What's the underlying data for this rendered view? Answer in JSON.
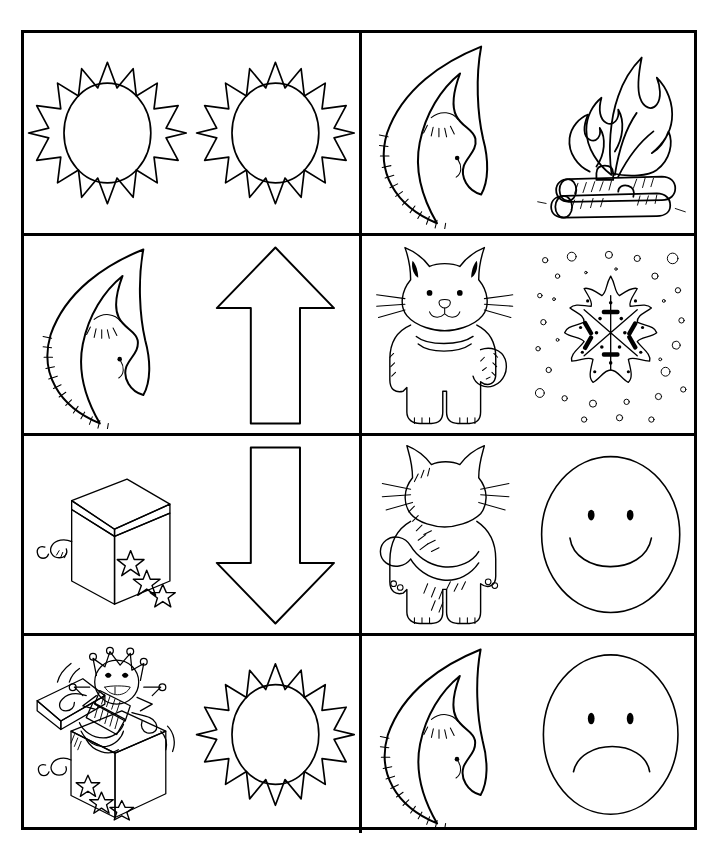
{
  "document": {
    "title": "Opposites Picture Cards Worksheet",
    "style": "black-and-white line art, uncolored",
    "background_color": "#ffffff",
    "ink_color": "#000000",
    "grid": {
      "rows": 4,
      "columns": 2,
      "cell_count": 8
    }
  },
  "cells": [
    {
      "id": "cell-1",
      "row": 1,
      "column": 1,
      "position": "top-left",
      "pair_label": "sun and sun",
      "items": [
        {
          "name": "sun",
          "icon": "sun-icon",
          "description": "sun with pointed triangular rays and oval face"
        },
        {
          "name": "sun",
          "icon": "sun-icon",
          "description": "sun with pointed triangular rays and oval face"
        }
      ]
    },
    {
      "id": "cell-2",
      "row": 1,
      "column": 2,
      "position": "top-right",
      "pair_label": "moon and campfire",
      "items": [
        {
          "name": "crescent moon",
          "icon": "moon-icon",
          "description": "sleeping crescent moon with closed eye and smile"
        },
        {
          "name": "campfire",
          "icon": "campfire-icon",
          "description": "flames rising from stacked logs"
        }
      ]
    },
    {
      "id": "cell-3",
      "row": 2,
      "column": 1,
      "position": "middle-upper-left",
      "pair_label": "moon and up arrow",
      "items": [
        {
          "name": "crescent moon",
          "icon": "moon-icon",
          "description": "sleeping crescent moon with closed eye and smile"
        },
        {
          "name": "up arrow",
          "icon": "arrow-up-icon",
          "description": "outlined arrow pointing up"
        }
      ]
    },
    {
      "id": "cell-4",
      "row": 2,
      "column": 2,
      "position": "middle-upper-right",
      "pair_label": "cat front and snowflake",
      "items": [
        {
          "name": "cat front view",
          "icon": "cat-front-icon",
          "description": "standing cat facing forward with whiskers and curled tail"
        },
        {
          "name": "snowflake",
          "icon": "snowflake-icon",
          "description": "six-pointed snowflake surrounded by falling snow dots"
        }
      ]
    },
    {
      "id": "cell-5",
      "row": 3,
      "column": 1,
      "position": "middle-lower-left",
      "pair_label": "closed box and down arrow",
      "items": [
        {
          "name": "closed jack-in-the-box",
          "icon": "closed-box-icon",
          "description": "cube box with crank handle and stars, lid shut"
        },
        {
          "name": "down arrow",
          "icon": "arrow-down-icon",
          "description": "outlined arrow pointing down"
        }
      ]
    },
    {
      "id": "cell-6",
      "row": 3,
      "column": 2,
      "position": "middle-lower-right",
      "pair_label": "cat back and happy face",
      "items": [
        {
          "name": "cat back view",
          "icon": "cat-back-icon",
          "description": "standing cat seen from behind with curling tail"
        },
        {
          "name": "happy face",
          "icon": "happy-face-icon",
          "description": "smiley face with two dot eyes and upward curved mouth"
        }
      ]
    },
    {
      "id": "cell-7",
      "row": 4,
      "column": 1,
      "position": "bottom-left",
      "pair_label": "open box and sun",
      "items": [
        {
          "name": "open jack-in-the-box",
          "icon": "open-box-icon",
          "description": "box with jester puppet springing out, lid open"
        },
        {
          "name": "sun",
          "icon": "sun-icon",
          "description": "sun with pointed triangular rays and oval face"
        }
      ]
    },
    {
      "id": "cell-8",
      "row": 4,
      "column": 2,
      "position": "bottom-right",
      "pair_label": "moon and sad face",
      "items": [
        {
          "name": "crescent moon",
          "icon": "moon-icon",
          "description": "sleeping crescent moon with closed eye and smile"
        },
        {
          "name": "sad face",
          "icon": "sad-face-icon",
          "description": "frowning face with two dot eyes and downward curved mouth"
        }
      ]
    }
  ]
}
